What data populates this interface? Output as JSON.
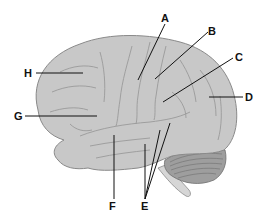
{
  "diagram": {
    "colors": {
      "cerebrum_fill": "#c8c8c8",
      "cerebrum_stroke": "#8a8a8a",
      "sulcus": "#9a9a9a",
      "cerebellum_fill": "#9e9e9e",
      "cerebellum_lines": "#6e6e6e",
      "brainstem_fill": "#d6d6d6",
      "leader_line": "#111111",
      "label_text": "#111111"
    },
    "labels": [
      {
        "id": "A",
        "text": "A",
        "x": 161,
        "y": 13,
        "line": [
          [
            165,
            24
          ],
          [
            138,
            80
          ]
        ]
      },
      {
        "id": "B",
        "text": "B",
        "x": 208,
        "y": 26,
        "line": [
          [
            208,
            32
          ],
          [
            155,
            79
          ]
        ]
      },
      {
        "id": "C",
        "text": "C",
        "x": 235,
        "y": 52,
        "line": [
          [
            233,
            58
          ],
          [
            163,
            102
          ]
        ]
      },
      {
        "id": "D",
        "text": "D",
        "x": 245,
        "y": 92,
        "line": [
          [
            243,
            97
          ],
          [
            209,
            97
          ]
        ]
      },
      {
        "id": "E",
        "text": "E",
        "x": 141,
        "y": 201,
        "lines": [
          [
            [
              145,
              199
            ],
            [
              145,
              144
            ]
          ],
          [
            [
              145,
              199
            ],
            [
              160,
              130
            ]
          ],
          [
            [
              145,
              199
            ],
            [
              170,
              123
            ]
          ]
        ]
      },
      {
        "id": "F",
        "text": "F",
        "x": 109,
        "y": 201,
        "line": [
          [
            114,
            199
          ],
          [
            114,
            135
          ]
        ]
      },
      {
        "id": "G",
        "text": "G",
        "x": 14,
        "y": 111,
        "line": [
          [
            25,
            116
          ],
          [
            97,
            116
          ]
        ]
      },
      {
        "id": "H",
        "text": "H",
        "x": 24,
        "y": 68,
        "line": [
          [
            36,
            73
          ],
          [
            83,
            73
          ]
        ]
      }
    ]
  }
}
